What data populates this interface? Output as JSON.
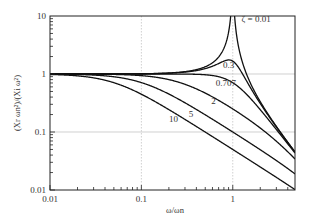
{
  "chart_data": {
    "type": "line",
    "title": "",
    "xlabel": "ω/ωn",
    "ylabel": "(Xr ωn²)/(Xi ω²)",
    "xscale": "log",
    "yscale": "log",
    "xlim": [
      0.01,
      4.8
    ],
    "ylim": [
      0.01,
      10
    ],
    "grid": true,
    "x_ticks": [
      0.01,
      0.1,
      1
    ],
    "x_tick_labels": [
      "0.01",
      "0.1",
      "1"
    ],
    "y_ticks": [
      0.01,
      0.1,
      1,
      10
    ],
    "y_tick_labels": [
      "0.01",
      "0.1",
      "1",
      "10"
    ],
    "legend": "inline curve labels",
    "series": [
      {
        "name": "ζ = 0.01",
        "zeta": 0.01,
        "label_pos": [
          1.25,
          8.0
        ]
      },
      {
        "name": "0.3",
        "zeta": 0.3,
        "label_pos": [
          0.78,
          1.25
        ]
      },
      {
        "name": "0.707",
        "zeta": 0.707,
        "label_pos": [
          0.65,
          0.62
        ]
      },
      {
        "name": "2",
        "zeta": 2,
        "label_pos": [
          0.58,
          0.3
        ]
      },
      {
        "name": "5",
        "zeta": 5,
        "label_pos": [
          0.33,
          0.185
        ]
      },
      {
        "name": "10",
        "zeta": 10,
        "label_pos": [
          0.2,
          0.15
        ]
      }
    ],
    "formula": "1/sqrt((1-r^2)^2 + (2*zeta*r)^2)",
    "sample_values": {
      "x": [
        0.01,
        0.1,
        0.5,
        1,
        2,
        4.8
      ],
      "ζ=0.01": [
        1.0,
        1.01,
        1.33,
        50,
        0.33,
        0.045
      ],
      "ζ=0.3": [
        1.0,
        1.0,
        1.19,
        1.67,
        0.29,
        0.045
      ],
      "ζ=0.707": [
        1.0,
        1.0,
        0.97,
        0.71,
        0.24,
        0.044
      ],
      "ζ=2": [
        1.0,
        0.94,
        0.48,
        0.25,
        0.12,
        0.04
      ],
      "ζ=5": [
        1.0,
        0.71,
        0.2,
        0.1,
        0.05,
        0.02
      ],
      "ζ=10": [
        1.0,
        0.45,
        0.1,
        0.05,
        0.025,
        0.0104
      ]
    }
  },
  "plot_area": {
    "left": 50,
    "top": 16,
    "right": 295,
    "bottom": 190
  },
  "colors": {
    "axis": "#222222",
    "curve": "#111111",
    "grid": "#bbbbbb"
  }
}
